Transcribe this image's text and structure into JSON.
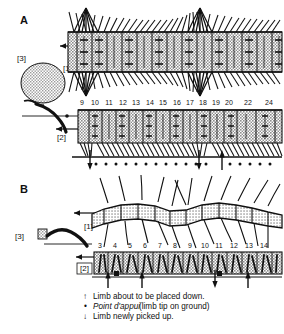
{
  "figure": {
    "title_visible": false,
    "background_color": "#ffffff",
    "ink_color": "#111111",
    "segment_fill": "#c9c9c9",
    "panels": [
      {
        "id": "A",
        "letter": "A",
        "callouts": [
          {
            "label": "[3]",
            "meaning": "head"
          },
          {
            "label": "[1]",
            "meaning": "dorsal-view-row"
          },
          {
            "label": "[2]",
            "meaning": "leg-tip-track-row"
          }
        ],
        "segment_numbers": [
          "9",
          "10",
          "11",
          "12",
          "13",
          "14",
          "15",
          "16",
          "17",
          "18",
          "19",
          "20",
          "22",
          "24"
        ],
        "rows": 2,
        "waves": 2
      },
      {
        "id": "B",
        "letter": "B",
        "callouts": [
          {
            "label": "[3]",
            "meaning": "head"
          },
          {
            "label": "[1]",
            "meaning": "dorsal-view-row"
          },
          {
            "label": "[2]",
            "meaning": "leg-tip-track-row"
          }
        ],
        "segment_numbers": [
          "3",
          "4",
          "5",
          "6",
          "7",
          "8",
          "9",
          "10",
          "11",
          "12",
          "13",
          "14"
        ],
        "rows": 2,
        "waves": 2
      }
    ],
    "legend": {
      "items": [
        {
          "symbol": "up-arrow",
          "glyph": "↑",
          "text": "Limb about to be placed down.",
          "italic_prefix": ""
        },
        {
          "symbol": "dot",
          "glyph": "•",
          "text": " (limb tip on ground)",
          "italic_prefix": "Point d'appui"
        },
        {
          "symbol": "down-arrow",
          "glyph": "↓",
          "text": "Limb newly picked up.",
          "italic_prefix": ""
        }
      ]
    }
  }
}
